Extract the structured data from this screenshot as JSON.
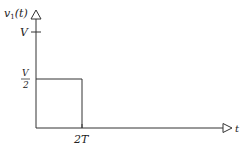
{
  "diagram": {
    "type": "signal-plot",
    "y_axis": {
      "label_base": "v",
      "label_sub": "1",
      "label_arg": "(t)"
    },
    "x_axis": {
      "label": "t"
    },
    "y_ticks": [
      {
        "label": "V",
        "position": "V"
      },
      {
        "label_num": "V",
        "label_den": "2",
        "position": "V/2"
      }
    ],
    "x_ticks": [
      {
        "label": "2T",
        "position": "2T"
      }
    ],
    "signal": {
      "description": "rectangular pulse of height V/2 from t=0 to t=2T",
      "segments": [
        {
          "from": [
            0,
            0.5
          ],
          "to": [
            2,
            0.5
          ]
        },
        {
          "from": [
            2,
            0.5
          ],
          "to": [
            2,
            0
          ]
        }
      ]
    },
    "colors": {
      "line": "#333333",
      "text": "#222222",
      "background": "#ffffff"
    }
  }
}
